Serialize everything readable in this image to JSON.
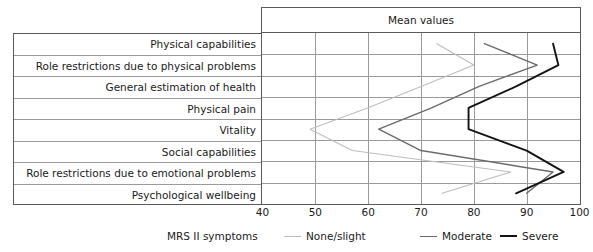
{
  "chart_title": "Mean values",
  "x_axis_name": "MRS II symptoms",
  "categories": [
    "Physical capabilities",
    "Role restrictions due to physical problems",
    "General estimation of health",
    "Physical pain",
    "Vitality",
    "Social capabilities",
    "Role restrictions due to emotional problems",
    "Psychological wellbeing"
  ],
  "ticks": [
    {
      "label": "40",
      "value": 40
    },
    {
      "label": "50",
      "value": 50
    },
    {
      "label": "60",
      "value": 60
    },
    {
      "label": "70",
      "value": 70
    },
    {
      "label": "80",
      "value": 80
    },
    {
      "label": "90",
      "value": 90
    },
    {
      "label": "100",
      "value": 100
    }
  ],
  "legend": [
    {
      "label": "None/slight",
      "color": "#bdbdbd"
    },
    {
      "label": "Moderate",
      "color": "#6a6a6a"
    },
    {
      "label": "Severe",
      "color": "#141414"
    }
  ],
  "colors": {
    "none_slight": "#bdbdbd",
    "moderate": "#6a6a6a",
    "severe": "#141414",
    "grid": "#9a9a9a",
    "frame": "#5a5a5a",
    "text": "#1a1a1a"
  },
  "chart_data": {
    "type": "line",
    "orientation": "horizontal",
    "title": "Mean values",
    "xlabel": "MRS II symptoms",
    "ylabel": "",
    "xlim": [
      40,
      100
    ],
    "grid": true,
    "legend_position": "bottom",
    "categories": [
      "Physical capabilities",
      "Role restrictions due to physical problems",
      "General estimation of health",
      "Physical pain",
      "Vitality",
      "Social capabilities",
      "Role restrictions due to emotional problems",
      "Psychological wellbeing"
    ],
    "series": [
      {
        "name": "None/slight",
        "color": "#bdbdbd",
        "values": [
          73,
          80,
          70,
          60,
          49,
          57,
          87,
          74
        ]
      },
      {
        "name": "Moderate",
        "color": "#6a6a6a",
        "values": [
          82,
          92,
          81,
          72,
          62,
          70,
          95,
          90
        ]
      },
      {
        "name": "Severe",
        "color": "#141414",
        "values": [
          95,
          96,
          88,
          79,
          79,
          90,
          97,
          88
        ]
      }
    ]
  }
}
